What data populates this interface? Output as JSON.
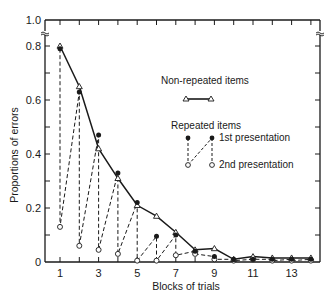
{
  "chart_data": {
    "type": "line",
    "title": "",
    "xlabel": "Blocks of trials",
    "ylabel": "Proportions of errors",
    "x": [
      1,
      2,
      3,
      4,
      5,
      6,
      7,
      8,
      9,
      10,
      11,
      12,
      13,
      14
    ],
    "xticks_labeled": [
      "1",
      "3",
      "5",
      "7",
      "9",
      "11",
      "13"
    ],
    "yticks": [
      "0",
      "0.2",
      "0.4",
      "0.6",
      "0.8",
      "1.0"
    ],
    "ylim": [
      0,
      1.0
    ],
    "axis_break": "between 0.8 and 1.0",
    "grid": false,
    "legend_position": "inside upper right",
    "series": [
      {
        "name": "Non-repeated items",
        "marker": "open-triangle",
        "line": "solid",
        "values": [
          0.8,
          0.65,
          0.42,
          0.31,
          0.21,
          0.17,
          0.11,
          0.045,
          0.05,
          0.01,
          0.02,
          0.015,
          0.015,
          0.015
        ]
      },
      {
        "name": "Repeated items - 1st presentation",
        "marker": "filled-circle",
        "line": "dashed",
        "values": [
          0.79,
          0.63,
          0.47,
          0.33,
          0.22,
          0.095,
          0.1,
          0.04,
          0.02,
          0.01,
          0.01,
          0.01,
          0.01,
          0.01
        ]
      },
      {
        "name": "Repeated items - 2nd presentation",
        "marker": "open-circle",
        "line": "dashed",
        "values": [
          0.13,
          0.06,
          0.045,
          0.03,
          0.005,
          0.005,
          0.025,
          0.03,
          0.01,
          0.005,
          0.01,
          0.005,
          0.005,
          0.005
        ]
      }
    ]
  },
  "legend": {
    "nonrepeated_label": "Non-repeated items",
    "repeated_label": "Repeated items",
    "first_label": "1st presentation",
    "second_label": "2nd presentation"
  }
}
